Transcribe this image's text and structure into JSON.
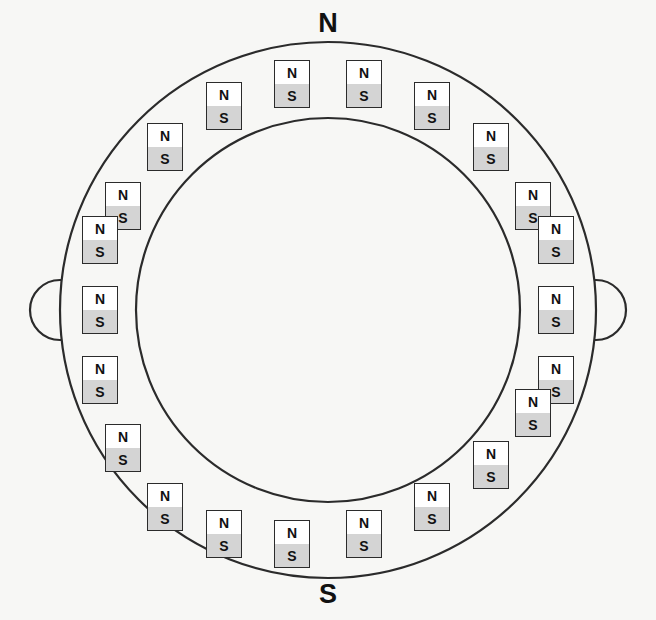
{
  "figure": {
    "background_color": "#f7f7f5",
    "line_color": "#2b2b2b",
    "north_fill": "#ffffff",
    "south_fill": "#d4d4d4"
  },
  "labels": {
    "north": "N",
    "south": "S"
  },
  "ring": {
    "center_x": 328,
    "center_y": 310,
    "outer_radius": 268,
    "inner_radius": 192,
    "lug_radius": 30,
    "lug_left_angle_deg": 180,
    "lug_right_angle_deg": 0,
    "lug_count": 2
  },
  "magnet": {
    "north_text": "N",
    "south_text": "S",
    "width": 36,
    "height": 48,
    "count": 20,
    "orientation": "upright",
    "placement_radius": 230
  },
  "magnets": [
    {
      "id": 1,
      "angle_deg": 99,
      "cx": 292,
      "cy": 84
    },
    {
      "id": 2,
      "angle_deg": 81,
      "cx": 364,
      "cy": 84
    },
    {
      "id": 3,
      "angle_deg": 63,
      "cx": 432,
      "cy": 106
    },
    {
      "id": 4,
      "angle_deg": 45,
      "cx": 491,
      "cy": 147
    },
    {
      "id": 5,
      "angle_deg": 27,
      "cx": 533,
      "cy": 206
    },
    {
      "id": 6,
      "angle_deg": 117,
      "cx": 224,
      "cy": 106
    },
    {
      "id": 7,
      "angle_deg": 135,
      "cx": 165,
      "cy": 147
    },
    {
      "id": 8,
      "angle_deg": 153,
      "cx": 123,
      "cy": 206
    },
    {
      "id": 9,
      "angle_deg": 171,
      "cx": 100,
      "cy": 240
    },
    {
      "id": 10,
      "angle_deg": 189,
      "cx": 100,
      "cy": 310
    },
    {
      "id": 11,
      "angle_deg": 207,
      "cx": 100,
      "cy": 380
    },
    {
      "id": 12,
      "angle_deg": 9,
      "cx": 556,
      "cy": 240
    },
    {
      "id": 13,
      "angle_deg": 351,
      "cx": 556,
      "cy": 310
    },
    {
      "id": 14,
      "angle_deg": 333,
      "cx": 556,
      "cy": 380
    },
    {
      "id": 15,
      "angle_deg": 225,
      "cx": 123,
      "cy": 448
    },
    {
      "id": 16,
      "angle_deg": 243,
      "cx": 165,
      "cy": 507
    },
    {
      "id": 17,
      "angle_deg": 261,
      "cx": 224,
      "cy": 534
    },
    {
      "id": 18,
      "angle_deg": 279,
      "cx": 292,
      "cy": 544
    },
    {
      "id": 19,
      "angle_deg": 297,
      "cx": 364,
      "cy": 534
    },
    {
      "id": 20,
      "angle_deg": 315,
      "cx": 432,
      "cy": 507
    },
    {
      "id": 21,
      "angle_deg": 315,
      "cx": 491,
      "cy": 465
    },
    {
      "id": 22,
      "angle_deg": 315,
      "cx": 533,
      "cy": 413
    }
  ]
}
